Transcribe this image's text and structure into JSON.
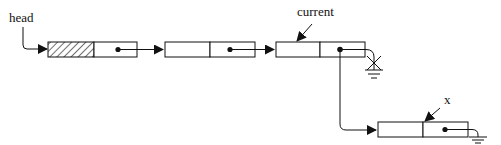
{
  "diagram": {
    "type": "linked-list-insertion",
    "labels": {
      "head": "head",
      "current": "current",
      "x": "x"
    },
    "nodes": [
      {
        "id": "node-1",
        "data_cell": "hatched",
        "pointer": "next"
      },
      {
        "id": "node-2",
        "data_cell": "empty",
        "pointer": "next"
      },
      {
        "id": "node-3",
        "data_cell": "empty",
        "pointer": "redirected-to-x",
        "old_link": "crossed-out-null"
      },
      {
        "id": "node-x",
        "data_cell": "empty",
        "pointer": "null"
      }
    ],
    "colors": {
      "stroke": "#111111",
      "background": "#ffffff"
    }
  }
}
